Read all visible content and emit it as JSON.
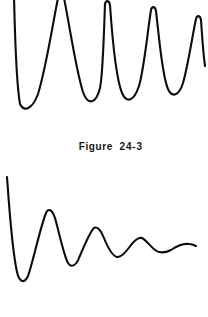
{
  "page": {
    "background_color": "#ffffff",
    "stroke_color": "#0d0d0d",
    "width": 208,
    "height": 317
  },
  "caption": {
    "label": "Figure",
    "number": "24-3",
    "full_text": "Figure  24-3"
  },
  "chart_data": [
    {
      "id": "upper-waveform",
      "type": "line",
      "title": "",
      "xlabel": "",
      "ylabel": "",
      "description": "Lightly damped sinusoidal oscillation, roughly 4.5 cycles, amplitude decaying slowly from left to right; first two positive peaks are clipped by the top edge of the frame.",
      "grid": false,
      "axes_visible": false,
      "legend": "none",
      "xlim": [
        0,
        208
      ],
      "ylim": [
        0,
        125
      ],
      "y_axis_inverted": true,
      "cycles": 4.5,
      "damping": "light",
      "peaks": [
        {
          "x": 14,
          "y": 0,
          "clipped": true
        },
        {
          "x": 58,
          "y": 0,
          "clipped": true
        },
        {
          "x": 103,
          "y": 2,
          "clipped": false
        },
        {
          "x": 150,
          "y": 8,
          "clipped": false
        },
        {
          "x": 196,
          "y": 17,
          "clipped": false
        }
      ],
      "troughs": [
        {
          "x": 20,
          "y": 105
        },
        {
          "x": 70,
          "y": 100
        },
        {
          "x": 118,
          "y": 96
        },
        {
          "x": 165,
          "y": 92
        }
      ],
      "path": "M 14 -4 C 15 40, 16 82, 20 104 C 24 112, 32 110, 38 94 C 46 68, 52 28, 58 -2 C 60 -6, 62 -6, 64 -2 C 70 28, 76 70, 83 92 C 88 106, 96 104, 100 88 C 103 74, 104 30, 105 4 C 106 0, 109 0, 110 5 C 112 34, 116 78, 122 93 C 127 104, 134 101, 139 86 C 144 70, 148 28, 151 10 C 152 6, 155 6, 156 11 C 159 36, 162 76, 168 89 C 172 98, 179 96, 183 83 C 188 66, 193 32, 196 19 C 197 15, 200 15, 201 20 C 202 34, 203 52, 205 66"
    },
    {
      "id": "lower-waveform",
      "type": "line",
      "title": "",
      "xlabel": "",
      "ylabel": "",
      "description": "Heavily damped oscillation decaying rapidly to a near-flat baseline; large initial negative excursion then progressively smaller ripples.",
      "grid": false,
      "axes_visible": false,
      "legend": "none",
      "xlim": [
        0,
        208
      ],
      "ylim": [
        170,
        295
      ],
      "y_axis_inverted": true,
      "cycles": 4,
      "damping": "heavy",
      "baseline_y": 247,
      "peaks": [
        {
          "x": 48,
          "y": 210
        },
        {
          "x": 95,
          "y": 228
        },
        {
          "x": 140,
          "y": 238
        },
        {
          "x": 186,
          "y": 243
        }
      ],
      "troughs": [
        {
          "x": 22,
          "y": 283
        },
        {
          "x": 70,
          "y": 265
        },
        {
          "x": 118,
          "y": 257
        },
        {
          "x": 162,
          "y": 252
        }
      ],
      "path": "M 7 177 C 9 205, 12 250, 17 272 C 19 281, 24 285, 28 276 C 33 262, 40 228, 46 213 C 48 208, 52 209, 55 218 C 59 232, 64 256, 68 263 C 71 268, 76 266, 79 258 C 84 246, 90 232, 94 228 C 97 226, 101 230, 104 238 C 108 248, 113 256, 117 257 C 121 258, 126 252, 131 245 C 135 240, 139 237, 142 238 C 146 240, 150 246, 155 250 C 159 253, 165 253, 171 250 C 177 246, 183 243, 189 244 C 192 244, 194 245, 196 246"
    }
  ]
}
